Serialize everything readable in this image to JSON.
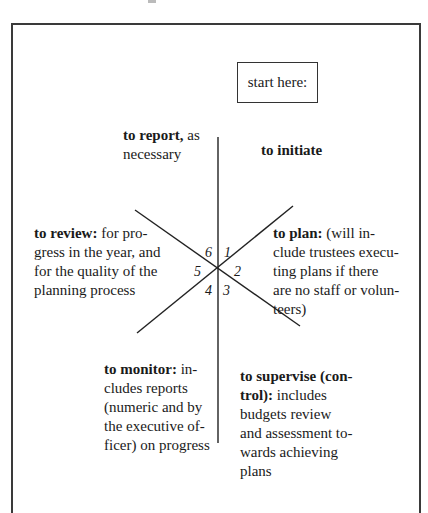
{
  "diagram": {
    "start_box": {
      "label": "start here:"
    },
    "segments": [
      {
        "number": "1",
        "title": "to initiate",
        "body": ""
      },
      {
        "number": "2",
        "title": "to plan:",
        "body": " (will in-",
        "lines": [
          "clude trustees execu-",
          "ting plans if there",
          "are no staff or volun-",
          "teers)"
        ]
      },
      {
        "number": "3",
        "title": "to supervise (con-",
        "title2": "trol):",
        "body": " includes",
        "lines": [
          "budgets review",
          "and assessment to-",
          "wards achieving",
          "plans"
        ]
      },
      {
        "number": "4",
        "title": "to monitor:",
        "body": " in-",
        "lines": [
          "cludes reports",
          "(numeric and by",
          "the executive of-",
          "ficer) on progress"
        ]
      },
      {
        "number": "5",
        "title": "to review:",
        "body": " for pro-",
        "lines": [
          "gress in the year, and",
          "for the quality of the",
          "planning process"
        ]
      },
      {
        "number": "6",
        "title": "to report,",
        "body": " as",
        "lines": [
          "necessary"
        ]
      }
    ]
  }
}
